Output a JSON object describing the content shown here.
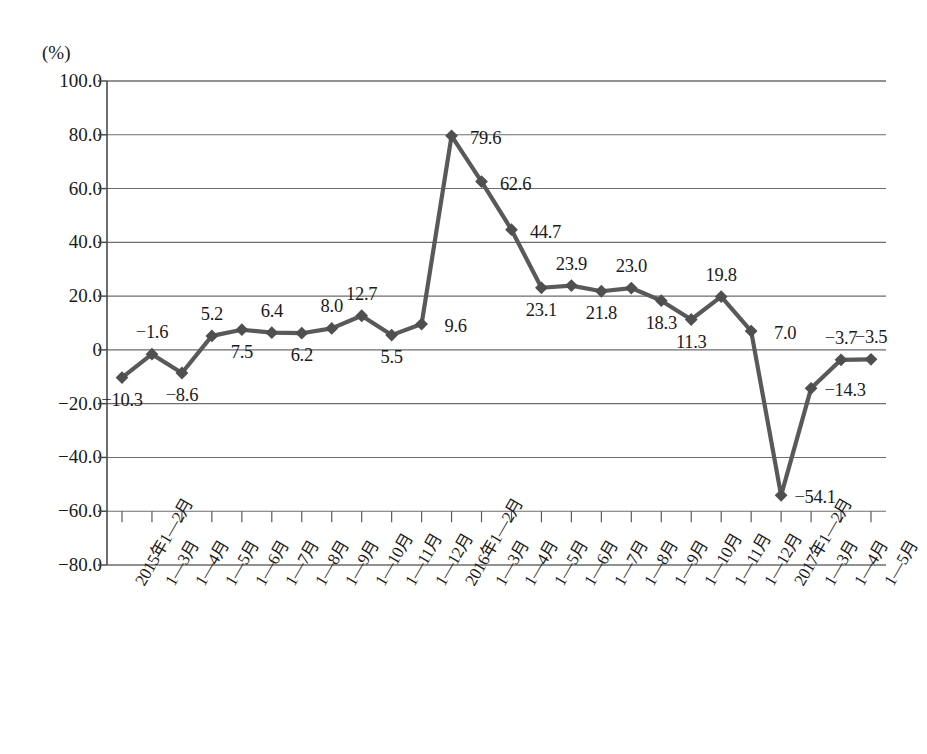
{
  "chart_data": {
    "type": "line",
    "title": "",
    "unit_label": "(%)",
    "xlabel": "",
    "ylabel": "",
    "ylim": [
      -80.0,
      100.0
    ],
    "yticks": [
      "100.0",
      "80.0",
      "60.0",
      "40.0",
      "20.0",
      "0",
      "-20.0",
      "-40.0",
      "-60.0",
      "-80.0"
    ],
    "ytick_values": [
      100.0,
      80.0,
      60.0,
      40.0,
      20.0,
      0,
      -20.0,
      -40.0,
      -60.0,
      -80.0
    ],
    "grid": true,
    "legend": "none",
    "marker": "diamond",
    "line_color": "#595959",
    "categories": [
      "2015年1—2月",
      "1—3月",
      "1—4月",
      "1—5月",
      "1—6月",
      "1—7月",
      "1—8月",
      "1—9月",
      "1—10月",
      "1—11月",
      "1—12月",
      "2016年1—2月",
      "1—3月",
      "1—4月",
      "1—5月",
      "1—6月",
      "1—7月",
      "1—8月",
      "1—9月",
      "1—10月",
      "1—11月",
      "1—12月",
      "2017年1—2月",
      "1—3月",
      "1—4月",
      "1—5月"
    ],
    "values": [
      -10.3,
      -1.6,
      -8.6,
      5.2,
      7.5,
      6.4,
      6.2,
      8.0,
      12.7,
      5.5,
      9.6,
      79.6,
      62.6,
      44.7,
      23.1,
      23.9,
      21.8,
      23.0,
      18.3,
      11.3,
      19.8,
      7.0,
      -54.1,
      -14.3,
      -3.7,
      -3.5
    ],
    "point_labels": [
      "-10.3",
      "-1.6",
      "-8.6",
      "5.2",
      "7.5",
      "6.4",
      "6.2",
      "8.0",
      "12.7",
      "5.5",
      "9.6",
      "79.6",
      "62.6",
      "44.7",
      "23.1",
      "23.9",
      "21.8",
      "23.0",
      "18.3",
      "11.3",
      "19.8",
      "7.0",
      "-54.1",
      "-14.3",
      "-3.7",
      "-3.5"
    ],
    "label_positions": [
      "below",
      "above",
      "below",
      "above",
      "below",
      "above",
      "below",
      "above",
      "above",
      "below",
      "right",
      "right",
      "right",
      "right",
      "below",
      "above",
      "below",
      "above",
      "below",
      "below",
      "above",
      "right",
      "right",
      "right",
      "above",
      "above"
    ]
  },
  "caption": {
    "text": ""
  }
}
